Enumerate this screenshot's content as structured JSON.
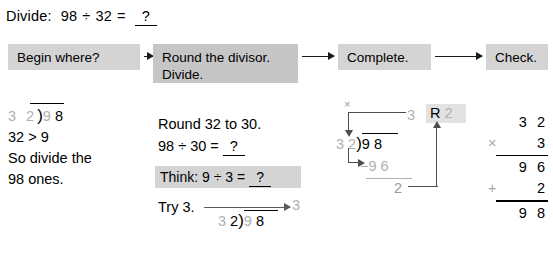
{
  "title": {
    "label": "Divide:",
    "dividend": "98",
    "operator": "÷",
    "divisor": "32",
    "equals": "=",
    "answer_blank": "?"
  },
  "flow": {
    "steps": [
      {
        "label": "Begin where?",
        "highlighted": false
      },
      {
        "label": "Round the divisor.\nDivide.",
        "highlighted": true
      },
      {
        "label": "Complete.",
        "highlighted": false
      },
      {
        "label": "Check.",
        "highlighted": false
      }
    ],
    "arrow_glyph": "→"
  },
  "column1": {
    "division": {
      "divisor_gray": "3 2",
      "bracket": ")",
      "dividend_gray": "9",
      "dividend_black": "8"
    },
    "comparison": "32 > 9",
    "explanation_line1": "So divide the",
    "explanation_line2": "98 ones."
  },
  "column2": {
    "round_text": "Round 32 to 30.",
    "estimate_dividend": "98",
    "estimate_operator": "÷",
    "estimate_divisor": "30",
    "estimate_equals": "=",
    "estimate_blank": "?",
    "think_label": "Think:",
    "think_dividend": "9",
    "think_operator": "÷",
    "think_divisor": "3",
    "think_equals": "=",
    "think_blank": "?",
    "try_text": "Try 3.",
    "try_quotient": "3",
    "division": {
      "divisor_gray": "3",
      "divisor_black": "2",
      "bracket": ")",
      "dividend_gray": "9",
      "dividend_black": "8"
    }
  },
  "column3": {
    "times_mark": "×",
    "quotient": "3",
    "remainder_label": "R",
    "remainder_value": "2",
    "divisor_d1": "3",
    "divisor_d2": "2",
    "bracket": ")",
    "dividend_d1": "9",
    "dividend_d2": "8",
    "subtract_sign": "−",
    "subtract_d1": "9",
    "subtract_d2": "6",
    "difference": "2"
  },
  "column4": {
    "rows": [
      {
        "operator": "",
        "value": "3 2",
        "rule_after": false
      },
      {
        "operator": "×",
        "value": "3",
        "rule_after": true
      },
      {
        "operator": "",
        "value": "9 6",
        "rule_after": false
      },
      {
        "operator": "+",
        "value": "2",
        "rule_after": true
      },
      {
        "operator": "",
        "value": "9 8",
        "rule_after": false
      }
    ]
  },
  "colors": {
    "box_gray": "#d4d4d4",
    "box_gray_highlight": "#c6c6c6",
    "faded_digit": "#b0b0b0",
    "arrow": "#4d4d4d",
    "ink": "#000000"
  }
}
